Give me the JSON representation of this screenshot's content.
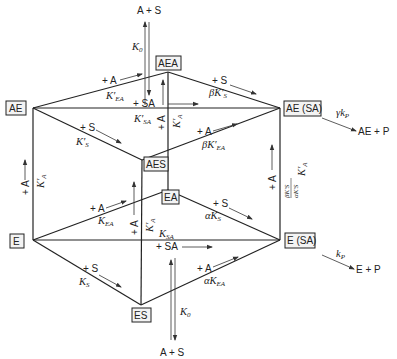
{
  "nodes": {
    "AE": "AE",
    "AEA": "AEA",
    "AE_SA": "AE (SA)",
    "AES": "AES",
    "EA": "EA",
    "E": "E",
    "E_SA": "E (SA)",
    "ES": "ES"
  },
  "top": {
    "reactants": "A + S",
    "k0": "K",
    "k0_sub": "0"
  },
  "bottom": {
    "reactants": "A + S",
    "k0": "K",
    "k0_sub": "0"
  },
  "upper_face": {
    "ae_aea_add": "+ A",
    "ae_aea_k": "K′",
    "ae_aea_k_sub": "EA",
    "aea_aesa_add": "+ S",
    "aea_aesa_k": "βK′",
    "aea_aesa_k_sub": "S",
    "ae_aesa_add": "+ SA",
    "ae_aesa_k": "K′",
    "ae_aesa_k_sub": "SA",
    "ae_aes_add": "+ S",
    "ae_aes_k": "K′",
    "ae_aes_k_sub": "S",
    "aes_aesa_add": "+ A",
    "aes_aesa_k": "βK′",
    "aes_aesa_k_sub": "EA"
  },
  "lower_face": {
    "e_ea_add": "+ A",
    "e_ea_k": "K",
    "e_ea_k_sub": "EA",
    "ea_esa_add": "+ S",
    "ea_esa_k": "αK",
    "ea_esa_k_sub": "S",
    "e_esa_add": "+ SA",
    "e_esa_k": "K",
    "e_esa_k_sub": "SA",
    "e_es_add": "+ S",
    "e_es_k": "K",
    "e_es_k_sub": "S",
    "es_esa_add": "+ A",
    "es_esa_k": "αK",
    "es_esa_k_sub": "EA"
  },
  "verticals": {
    "left_add": "+ A",
    "left_k": "K′",
    "left_k_sub": "A",
    "center_back_add": "+ A",
    "center_back_k": "K′",
    "center_back_k_sub": "A",
    "center_front_add": "+ A",
    "center_front_k": "K′",
    "center_front_k_sub": "A",
    "right_add": "+ A",
    "right_k": "K′",
    "right_k_sub": "A",
    "right_factor_num": "βK′S",
    "right_factor_den": "αK′S"
  },
  "products": {
    "upper_rate": "γk",
    "upper_rate_sub": "P",
    "upper_product": "AE + P",
    "lower_rate": "k",
    "lower_rate_sub": "P",
    "lower_product": "E + P"
  }
}
